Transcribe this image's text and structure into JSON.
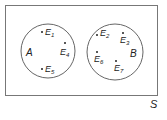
{
  "diagram": {
    "type": "venn",
    "universe_label": "S",
    "sets": [
      {
        "label": "A",
        "elements": [
          "E1",
          "E4",
          "E5"
        ]
      },
      {
        "label": "B",
        "elements": [
          "E2",
          "E3",
          "E6",
          "E7"
        ]
      }
    ],
    "colors": {
      "stroke": "#555555",
      "text": "#222222",
      "background": "#ffffff"
    }
  },
  "labels": {
    "S": "S",
    "A": "A",
    "B": "B",
    "E1": "E",
    "E1_sub": "1",
    "E2": "E",
    "E2_sub": "2",
    "E3": "E",
    "E3_sub": "3",
    "E4": "E",
    "E4_sub": "4",
    "E5": "E",
    "E5_sub": "5",
    "E6": "E",
    "E6_sub": "6",
    "E7": "E",
    "E7_sub": "7"
  }
}
